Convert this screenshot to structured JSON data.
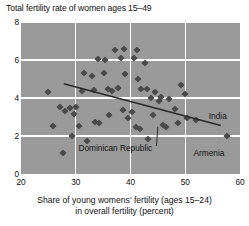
{
  "chart_data": {
    "type": "scatter",
    "title": "Total fertility rate of women ages 15–49",
    "xlabel_line1": "Share of young womens' fertility (ages 15–24)",
    "xlabel_line2": "in overall fertility (percent)",
    "ylabel": "Total fertility rate of women ages 15–49",
    "xlim": [
      20,
      60
    ],
    "ylim": [
      0,
      8
    ],
    "xticks": [
      20,
      30,
      40,
      50,
      60
    ],
    "yticks": [
      0,
      2,
      4,
      6,
      8
    ],
    "grid": true,
    "legend": "none",
    "plot_background": "#9a9a9a",
    "marker_color": "#4a4a4a",
    "marker_shape": "diamond",
    "trendline": {
      "label": "fitted regression line",
      "x_start": 27.8,
      "y_start": 4.75,
      "x_end": 56.5,
      "y_end": 2.55,
      "color": "#2b2b2b"
    },
    "annotations": [
      {
        "text": "India",
        "x": 54.3,
        "y": 3.0,
        "point_x": 50.4,
        "point_y": 2.95
      },
      {
        "text": "Dominican Republic",
        "x": 30.5,
        "y": 1.32,
        "point_x": 45.0,
        "point_y": 2.6
      },
      {
        "text": "Armenia",
        "x": 51.5,
        "y": 1.05,
        "point_x": 57.6,
        "point_y": 2.0
      }
    ],
    "points": [
      {
        "x": 31.2,
        "y": 4.35
      },
      {
        "x": 25.0,
        "y": 4.3
      },
      {
        "x": 27.2,
        "y": 3.55
      },
      {
        "x": 28.1,
        "y": 3.3
      },
      {
        "x": 28.9,
        "y": 3.45
      },
      {
        "x": 29.6,
        "y": 3.15
      },
      {
        "x": 30.0,
        "y": 3.55
      },
      {
        "x": 25.8,
        "y": 2.55
      },
      {
        "x": 29.4,
        "y": 2.02
      },
      {
        "x": 27.6,
        "y": 1.1
      },
      {
        "x": 31.5,
        "y": 5.3
      },
      {
        "x": 33.0,
        "y": 5.15
      },
      {
        "x": 33.4,
        "y": 4.42
      },
      {
        "x": 34.0,
        "y": 6.05
      },
      {
        "x": 35.4,
        "y": 6.0
      },
      {
        "x": 35.1,
        "y": 5.3
      },
      {
        "x": 36.6,
        "y": 4.35
      },
      {
        "x": 37.2,
        "y": 6.55
      },
      {
        "x": 38.3,
        "y": 6.1
      },
      {
        "x": 38.9,
        "y": 6.6
      },
      {
        "x": 39.0,
        "y": 5.25
      },
      {
        "x": 40.6,
        "y": 6.1
      },
      {
        "x": 41.2,
        "y": 6.55
      },
      {
        "x": 41.4,
        "y": 5.0
      },
      {
        "x": 42.0,
        "y": 4.45
      },
      {
        "x": 42.6,
        "y": 5.85
      },
      {
        "x": 43.0,
        "y": 4.45
      },
      {
        "x": 43.8,
        "y": 4.0
      },
      {
        "x": 44.2,
        "y": 3.1
      },
      {
        "x": 44.5,
        "y": 4.3
      },
      {
        "x": 45.2,
        "y": 3.85
      },
      {
        "x": 45.6,
        "y": 4.05
      },
      {
        "x": 46.0,
        "y": 2.6
      },
      {
        "x": 46.4,
        "y": 2.5
      },
      {
        "x": 36.0,
        "y": 3.1
      },
      {
        "x": 33.6,
        "y": 2.75
      },
      {
        "x": 34.2,
        "y": 2.7
      },
      {
        "x": 32.0,
        "y": 1.75
      },
      {
        "x": 38.6,
        "y": 3.35
      },
      {
        "x": 39.6,
        "y": 2.95
      },
      {
        "x": 40.3,
        "y": 3.25
      },
      {
        "x": 41.0,
        "y": 2.45
      },
      {
        "x": 41.8,
        "y": 2.35
      },
      {
        "x": 43.2,
        "y": 1.85
      },
      {
        "x": 47.0,
        "y": 3.95
      },
      {
        "x": 48.2,
        "y": 3.4
      },
      {
        "x": 48.6,
        "y": 2.7
      },
      {
        "x": 50.4,
        "y": 2.95
      },
      {
        "x": 50.0,
        "y": 4.2
      },
      {
        "x": 49.2,
        "y": 4.7
      },
      {
        "x": 52.0,
        "y": 2.85
      },
      {
        "x": 57.6,
        "y": 2.0
      },
      {
        "x": 30.6,
        "y": 2.55
      },
      {
        "x": 35.8,
        "y": 4.5
      },
      {
        "x": 37.8,
        "y": 4.55
      }
    ]
  }
}
